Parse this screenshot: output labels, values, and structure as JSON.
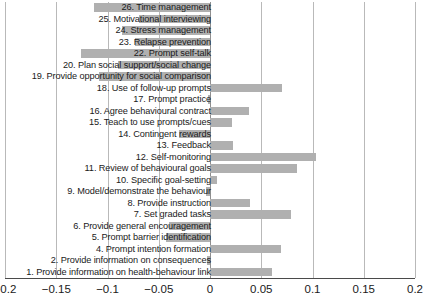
{
  "chart_data": {
    "type": "bar",
    "orientation": "horizontal",
    "title": "",
    "xlabel": "",
    "ylabel": "",
    "xlim": [
      -0.2,
      0.2
    ],
    "grid": true,
    "legend": null,
    "bar_color": "#b0b0b0",
    "xticks": [
      "−0.2",
      "−0.15",
      "−0.1",
      "−0.05",
      "0",
      "0.05",
      "0.1",
      "0.15",
      "0.2"
    ],
    "xtick_values": [
      -0.2,
      -0.15,
      -0.1,
      -0.05,
      0,
      0.05,
      0.1,
      0.15,
      0.2
    ],
    "categories": [
      "26. Time management",
      "25. Motivational interviewing",
      "24. Stress management",
      "23. Relapse prevention",
      "22. Prompt self-talk",
      "20. Plan social support/social change",
      "19. Provide opportunity for social comparison",
      "18. Use of follow-up prompts",
      "17. Prompt practice",
      "16. Agree behavioural contract",
      "15. Teach to use prompts/cues",
      "14. Contingent rewards",
      "13. Feedback",
      "12. Self-monitoring",
      "11. Review of behavioural goals",
      "10. Specific goal-setting",
      "9. Model/demonstrate the behaviour",
      "8. Provide instruction",
      "7. Set graded tasks",
      "6. Provide general encouragement",
      "5. Prompt barrier identification",
      "4. Prompt intention formation",
      "2. Provide information on consequences",
      "1. Provide information on health-behaviour link"
    ],
    "values": [
      -0.113,
      -0.069,
      -0.086,
      -0.073,
      -0.126,
      -0.09,
      -0.108,
      0.07,
      -0.002,
      0.038,
      0.021,
      -0.03,
      0.022,
      0.103,
      0.085,
      0.007,
      -0.004,
      0.039,
      0.079,
      -0.04,
      -0.043,
      0.069,
      -0.003,
      0.06
    ]
  }
}
